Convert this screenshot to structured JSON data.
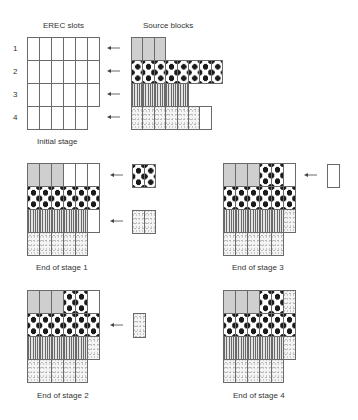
{
  "headers": {
    "erec_slots": "EREC slots",
    "source_blocks": "Source blocks"
  },
  "row_numbers": [
    "1",
    "2",
    "3",
    "4"
  ],
  "patterns": {
    "G": "gray-dotted",
    "P": "polka-dot",
    "S": "vertical-stripes",
    "L": "light-dotted",
    "E": "empty"
  },
  "initial": {
    "label": "Initial stage",
    "slots": [
      [
        "E",
        "E",
        "E",
        "E",
        "E",
        "E"
      ],
      [
        "E",
        "E",
        "E",
        "E",
        "E",
        "E"
      ],
      [
        "E",
        "E",
        "E",
        "E",
        "E",
        "E"
      ],
      [
        "E",
        "E",
        "E",
        "E",
        "E"
      ]
    ],
    "source_blocks": [
      [
        "G",
        "G",
        "G"
      ],
      [
        "P",
        "P",
        "P",
        "P",
        "P",
        "P",
        "P",
        "P"
      ],
      [
        "S",
        "S",
        "S",
        "S",
        "S"
      ],
      [
        "L",
        "L",
        "L",
        "L",
        "L",
        "L",
        "E"
      ]
    ]
  },
  "stages": [
    {
      "label": "End of stage 1",
      "slots": [
        [
          "G",
          "G",
          "G",
          "E",
          "E",
          "E"
        ],
        [
          "P",
          "P",
          "P",
          "P",
          "P",
          "P"
        ],
        [
          "S",
          "S",
          "S",
          "S",
          "S",
          "E"
        ],
        [
          "L",
          "L",
          "L",
          "L",
          "L"
        ]
      ],
      "leftovers": [
        {
          "row": 1,
          "cells": [
            "P",
            "P"
          ]
        },
        {
          "row": 3,
          "cells": [
            "L",
            "L"
          ]
        }
      ]
    },
    {
      "label": "End of stage 2",
      "slots": [
        [
          "G",
          "G",
          "G",
          "P",
          "P",
          "E"
        ],
        [
          "P",
          "P",
          "P",
          "P",
          "P",
          "P"
        ],
        [
          "S",
          "S",
          "S",
          "S",
          "S",
          "L"
        ],
        [
          "L",
          "L",
          "L",
          "L",
          "L"
        ]
      ],
      "leftovers": [
        {
          "row": 2,
          "cells": [
            "L"
          ]
        }
      ]
    },
    {
      "label": "End of stage 3",
      "slots": [
        [
          "G",
          "G",
          "G",
          "P",
          "P",
          "E"
        ],
        [
          "P",
          "P",
          "P",
          "P",
          "P",
          "P"
        ],
        [
          "S",
          "S",
          "S",
          "S",
          "S",
          "L"
        ],
        [
          "L",
          "L",
          "L",
          "L",
          "L"
        ]
      ],
      "leftovers": [
        {
          "row": 1,
          "cells": [
            "E"
          ]
        }
      ]
    },
    {
      "label": "End of stage 4",
      "slots": [
        [
          "G",
          "G",
          "G",
          "P",
          "P",
          "L"
        ],
        [
          "P",
          "P",
          "P",
          "P",
          "P",
          "P"
        ],
        [
          "S",
          "S",
          "S",
          "S",
          "S",
          "L"
        ],
        [
          "L",
          "L",
          "L",
          "L",
          "L"
        ]
      ],
      "leftovers": []
    }
  ]
}
